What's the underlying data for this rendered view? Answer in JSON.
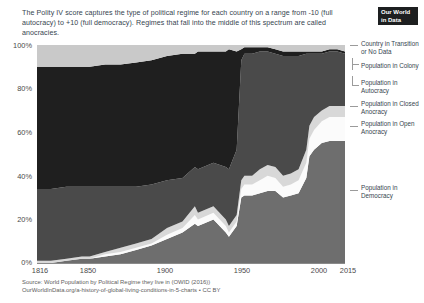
{
  "header": {
    "subtitle": "The Polity IV score captures the type of political regime for each country on a range from -10 (full autocracy) to +10 (full democracy). Regimes that fall into the middle of this spectrum are called anocracies.",
    "logo_line1": "Our World",
    "logo_line2": "in Data"
  },
  "footer": {
    "source_line1": "Source: World Population by Political Regime they live in (OWID (2016))",
    "source_line2": "OurWorldInData.org/a-history-of-global-living-conditions-in-5-charts • CC BY"
  },
  "legend": [
    {
      "label": "Country in Transition or No Data",
      "color": "#c9c9c9"
    },
    {
      "label": "Population in Colony",
      "color": "#1f1f1f"
    },
    {
      "label": "Population in Autocracy",
      "color": "#4a4a4a"
    },
    {
      "label": "Population in Closed Anocracy",
      "color": "#d8d8d8"
    },
    {
      "label": "Population in Open Anocracy",
      "color": "#fbfbfb"
    },
    {
      "label": "Population in Democracy",
      "color": "#6e6e6e"
    }
  ],
  "chart_data": {
    "type": "area",
    "title": "",
    "subtitle": "The Polity IV score captures the type of political regime for each country on a range from -10 (full autocracy) to +10 (full democracy). Regimes that fall into the middle of this spectrum are called anocracies.",
    "xlabel": "",
    "ylabel": "",
    "stacked": true,
    "normalized_percent": true,
    "grid": true,
    "legend_position": "right",
    "xlim": [
      1816,
      2015
    ],
    "ylim": [
      0,
      100
    ],
    "ytick_labels": [
      "0%",
      "20%",
      "40%",
      "60%",
      "80%",
      "100%"
    ],
    "ytick_values": [
      0,
      20,
      40,
      60,
      80,
      100
    ],
    "xtick_labels": [
      "1816",
      "1850",
      "1900",
      "1950",
      "2000",
      "2015"
    ],
    "xtick_values": [
      1816,
      1850,
      1900,
      1950,
      2000,
      2015
    ],
    "x": [
      1816,
      1825,
      1835,
      1845,
      1850,
      1860,
      1870,
      1880,
      1890,
      1900,
      1910,
      1918,
      1920,
      1930,
      1938,
      1940,
      1945,
      1948,
      1950,
      1955,
      1960,
      1965,
      1970,
      1975,
      1980,
      1985,
      1990,
      1992,
      1995,
      2000,
      2005,
      2010,
      2015
    ],
    "series": [
      {
        "name": "Population in Democracy",
        "color": "#6e6e6e",
        "values": [
          0,
          0,
          1,
          2,
          2,
          3,
          4,
          6,
          8,
          11,
          14,
          18,
          17,
          20,
          14,
          12,
          17,
          30,
          31,
          31,
          32,
          33,
          33,
          30,
          31,
          32,
          39,
          49,
          52,
          55,
          56,
          56,
          56
        ]
      },
      {
        "name": "Population in Open Anocracy",
        "color": "#fbfbfb",
        "values": [
          0,
          0,
          0,
          0,
          0,
          1,
          1,
          1,
          1,
          2,
          2,
          4,
          3,
          3,
          3,
          2,
          2,
          4,
          5,
          5,
          6,
          7,
          6,
          5,
          5,
          6,
          7,
          8,
          9,
          10,
          11,
          11,
          11
        ]
      },
      {
        "name": "Population in Closed Anocracy",
        "color": "#d8d8d8",
        "values": [
          1,
          1,
          1,
          1,
          1,
          1,
          2,
          2,
          2,
          3,
          3,
          4,
          3,
          3,
          3,
          3,
          3,
          4,
          4,
          4,
          5,
          5,
          5,
          5,
          5,
          5,
          6,
          6,
          6,
          5,
          5,
          5,
          5
        ]
      },
      {
        "name": "Population in Autocracy",
        "color": "#4a4a4a",
        "values": [
          33,
          33,
          33,
          32,
          32,
          30,
          28,
          26,
          25,
          22,
          20,
          18,
          20,
          20,
          24,
          26,
          30,
          55,
          56,
          56,
          54,
          52,
          52,
          55,
          54,
          52,
          44,
          33,
          29,
          26,
          25,
          25,
          24
        ]
      },
      {
        "name": "Population in Colony",
        "color": "#1f1f1f",
        "values": [
          56,
          56,
          55,
          55,
          55,
          56,
          56,
          57,
          57,
          57,
          57,
          52,
          54,
          51,
          53,
          55,
          45,
          5,
          3,
          3,
          2,
          2,
          2,
          2,
          2,
          2,
          1,
          1,
          1,
          1,
          1,
          1,
          1
        ]
      },
      {
        "name": "Country in Transition or No Data",
        "color": "#c9c9c9",
        "values": [
          10,
          10,
          10,
          10,
          10,
          9,
          9,
          8,
          7,
          5,
          4,
          4,
          3,
          3,
          3,
          2,
          3,
          2,
          1,
          1,
          1,
          1,
          2,
          3,
          3,
          3,
          3,
          3,
          3,
          3,
          2,
          2,
          3
        ]
      }
    ]
  }
}
